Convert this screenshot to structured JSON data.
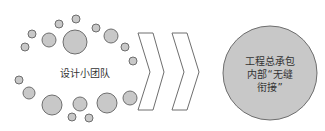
{
  "diagram": {
    "left_group": {
      "label": "设计小团队",
      "circles": [
        {
          "cx": 59,
          "cy": 24,
          "r": 4
        },
        {
          "cx": 76,
          "cy": 19,
          "r": 4
        },
        {
          "cx": 32,
          "cy": 34,
          "r": 4
        },
        {
          "cx": 25,
          "cy": 47,
          "r": 4
        },
        {
          "cx": 49,
          "cy": 40,
          "r": 7
        },
        {
          "cx": 75,
          "cy": 42,
          "r": 12
        },
        {
          "cx": 96,
          "cy": 28,
          "r": 4
        },
        {
          "cx": 111,
          "cy": 36,
          "r": 7
        },
        {
          "cx": 125,
          "cy": 47,
          "r": 4
        },
        {
          "cx": 133,
          "cy": 61,
          "r": 4
        },
        {
          "cx": 19,
          "cy": 80,
          "r": 4
        },
        {
          "cx": 29,
          "cy": 93,
          "r": 6
        },
        {
          "cx": 52,
          "cy": 105,
          "r": 10
        },
        {
          "cx": 80,
          "cy": 104,
          "r": 7
        },
        {
          "cx": 72,
          "cy": 117,
          "r": 4
        },
        {
          "cx": 89,
          "cy": 118,
          "r": 4
        },
        {
          "cx": 107,
          "cy": 103,
          "r": 10
        },
        {
          "cx": 130,
          "cy": 98,
          "r": 7
        }
      ]
    },
    "arrows": {
      "count": 2,
      "type": "chevron"
    },
    "right_node": {
      "lines": [
        "工程总承包",
        "内部“无缝",
        "衔接”"
      ]
    },
    "colors": {
      "fill": "#c8c8c8",
      "stroke": "#6e6e6e"
    }
  }
}
